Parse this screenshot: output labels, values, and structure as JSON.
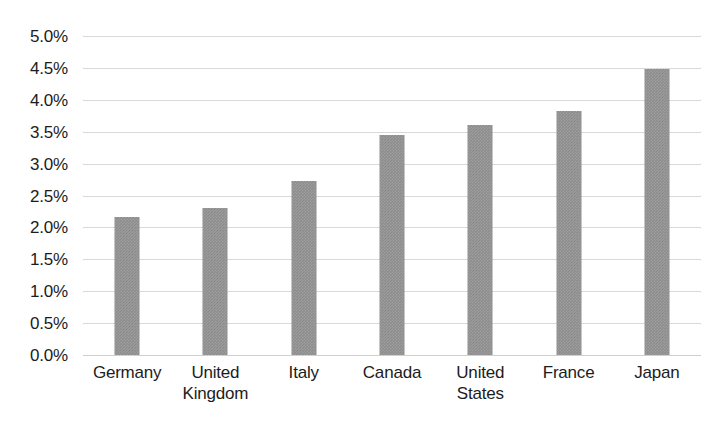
{
  "chart_data": {
    "type": "bar",
    "title": "",
    "subtitle": "",
    "xlabel": "",
    "ylabel": "",
    "categories": [
      "Germany",
      "United Kingdom",
      "Italy",
      "Canada",
      "United States",
      "France",
      "Japan"
    ],
    "category_lines": [
      [
        "Germany"
      ],
      [
        "United",
        "Kingdom"
      ],
      [
        "Italy"
      ],
      [
        "Canada"
      ],
      [
        "United",
        "States"
      ],
      [
        "France"
      ],
      [
        "Japan"
      ]
    ],
    "values": [
      2.17,
      2.3,
      2.72,
      3.45,
      3.6,
      3.82,
      4.48
    ],
    "value_labels": [
      "2.17%",
      "2.30%",
      "2.72%",
      "3.45%",
      "3.60%",
      "3.82%",
      "4.48%"
    ],
    "unit": "%",
    "ylim": [
      0,
      5
    ],
    "ytick_values": [
      5.0,
      4.5,
      4.0,
      3.5,
      3.0,
      2.5,
      2.0,
      1.5,
      1.0,
      0.5,
      0.0
    ],
    "ytick_labels": [
      "5.0%",
      "4.5%",
      "4.0%",
      "3.5%",
      "3.0%",
      "2.5%",
      "2.0%",
      "1.5%",
      "1.0%",
      "0.5%",
      "0.0%"
    ],
    "grid": true,
    "grid_axis": "y",
    "legend": false,
    "legend_position": "none",
    "bar_color": "#8c8c8c",
    "gridline_color": "#d9d9d9",
    "background_color": "#ffffff",
    "text_color": "#1c1c1c"
  }
}
